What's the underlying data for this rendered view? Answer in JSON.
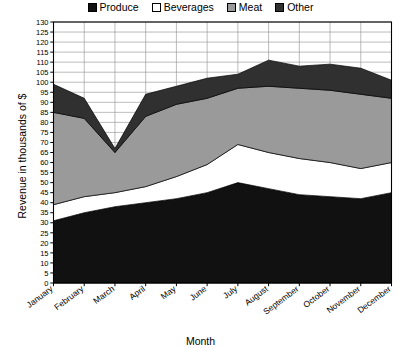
{
  "legend": {
    "items": [
      {
        "label": "Produce",
        "color": "#111111"
      },
      {
        "label": "Beverages",
        "color": "#ffffff"
      },
      {
        "label": "Meat",
        "color": "#9a9a9a"
      },
      {
        "label": "Other",
        "color": "#303030"
      }
    ]
  },
  "axes": {
    "ytitle": "Revenue in thousands of $",
    "xtitle": "Month"
  },
  "chart_data": {
    "type": "area",
    "stacked": true,
    "title": "",
    "xlabel": "Month",
    "ylabel": "Revenue in thousands of $",
    "ylim": [
      0,
      130
    ],
    "ytick_step": 5,
    "grid": true,
    "legend_position": "top-center",
    "categories": [
      "January",
      "February",
      "March",
      "April",
      "May",
      "June",
      "July",
      "August",
      "September",
      "October",
      "November",
      "December"
    ],
    "yticks": [
      "0",
      "5",
      "10",
      "15",
      "20",
      "25",
      "30",
      "35",
      "40",
      "45",
      "50",
      "55",
      "60",
      "65",
      "70",
      "75",
      "80",
      "85",
      "90",
      "95",
      "100",
      "105",
      "110",
      "115",
      "120",
      "125",
      "130"
    ],
    "series": [
      {
        "name": "Produce",
        "color": "#111111",
        "values": [
          31,
          35,
          38,
          40,
          42,
          45,
          50,
          47,
          44,
          43,
          42,
          45
        ]
      },
      {
        "name": "Beverages",
        "color": "#ffffff",
        "values": [
          8,
          8,
          7,
          8,
          11,
          14,
          19,
          18,
          18,
          17,
          15,
          15
        ]
      },
      {
        "name": "Meat",
        "color": "#9a9a9a",
        "values": [
          46,
          39,
          20,
          35,
          36,
          33,
          28,
          33,
          35,
          36,
          37,
          32
        ]
      },
      {
        "name": "Other",
        "color": "#303030",
        "values": [
          14,
          10,
          2,
          11,
          9,
          10,
          7,
          13,
          11,
          13,
          13,
          9
        ]
      }
    ],
    "totals": [
      99,
      92,
      67,
      94,
      98,
      102,
      104,
      111,
      108,
      109,
      107,
      101
    ]
  }
}
